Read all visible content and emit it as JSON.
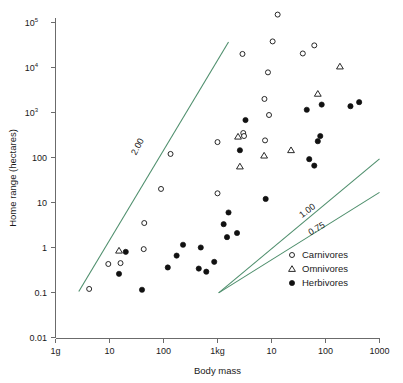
{
  "chart_data": {
    "type": "scatter",
    "title": "",
    "xlabel": "Body mass",
    "ylabel": "Home range (hectares)",
    "x_scale": "log",
    "y_scale": "log",
    "xlim": [
      1,
      1000000
    ],
    "ylim": [
      0.01,
      100000
    ],
    "grid": false,
    "legend_position": "bottom-right",
    "x_tick_labels": [
      "1g",
      "10",
      "100",
      "1kg",
      "10",
      "100",
      "1000"
    ],
    "x_tick_values": [
      1,
      10,
      100,
      1000,
      10000,
      100000,
      1000000
    ],
    "y_tick_labels": [
      "10⁵",
      "10⁴",
      "10³",
      "100",
      "10",
      "1",
      "0.1",
      "0.01"
    ],
    "y_tick_values": [
      100000,
      10000,
      1000,
      100,
      10,
      1,
      0.1,
      0.01
    ],
    "series": [
      {
        "name": "Carnivores",
        "marker": "open-circle",
        "color": "#111111",
        "points": [
          {
            "x": 4.2,
            "y": 0.12
          },
          {
            "x": 9.5,
            "y": 0.43
          },
          {
            "x": 16,
            "y": 0.45
          },
          {
            "x": 43,
            "y": 0.92
          },
          {
            "x": 44,
            "y": 3.5
          },
          {
            "x": 90,
            "y": 20
          },
          {
            "x": 135,
            "y": 120
          },
          {
            "x": 1000,
            "y": 16
          },
          {
            "x": 1000,
            "y": 220
          },
          {
            "x": 2900,
            "y": 20000
          },
          {
            "x": 3000,
            "y": 350
          },
          {
            "x": 3100,
            "y": 300
          },
          {
            "x": 7400,
            "y": 2000
          },
          {
            "x": 7600,
            "y": 240
          },
          {
            "x": 8600,
            "y": 7800
          },
          {
            "x": 9000,
            "y": 880
          },
          {
            "x": 10500,
            "y": 38000
          },
          {
            "x": 13000,
            "y": 150000
          },
          {
            "x": 38000,
            "y": 20500
          },
          {
            "x": 62000,
            "y": 31000
          }
        ]
      },
      {
        "name": "Omnivores",
        "marker": "open-triangle",
        "color": "#111111",
        "points": [
          {
            "x": 15,
            "y": 0.85
          },
          {
            "x": 2400,
            "y": 290
          },
          {
            "x": 2600,
            "y": 63
          },
          {
            "x": 7300,
            "y": 110
          },
          {
            "x": 23000,
            "y": 145
          },
          {
            "x": 72000,
            "y": 2600
          },
          {
            "x": 185000,
            "y": 10500
          }
        ]
      },
      {
        "name": "Herbivores",
        "marker": "filled-circle",
        "color": "#111111",
        "points": [
          {
            "x": 15,
            "y": 0.26
          },
          {
            "x": 20,
            "y": 0.8
          },
          {
            "x": 40,
            "y": 0.115
          },
          {
            "x": 120,
            "y": 0.36
          },
          {
            "x": 175,
            "y": 0.66
          },
          {
            "x": 230,
            "y": 1.15
          },
          {
            "x": 450,
            "y": 0.34
          },
          {
            "x": 490,
            "y": 1.0
          },
          {
            "x": 620,
            "y": 0.29
          },
          {
            "x": 870,
            "y": 0.48
          },
          {
            "x": 1300,
            "y": 3.3
          },
          {
            "x": 1500,
            "y": 1.7
          },
          {
            "x": 1600,
            "y": 6.0
          },
          {
            "x": 2300,
            "y": 2.1
          },
          {
            "x": 2600,
            "y": 145
          },
          {
            "x": 3300,
            "y": 680
          },
          {
            "x": 7800,
            "y": 12
          },
          {
            "x": 45000,
            "y": 1150
          },
          {
            "x": 50000,
            "y": 92
          },
          {
            "x": 62000,
            "y": 66
          },
          {
            "x": 72000,
            "y": 230
          },
          {
            "x": 80000,
            "y": 300
          },
          {
            "x": 85000,
            "y": 1500
          },
          {
            "x": 290000,
            "y": 1380
          },
          {
            "x": 420000,
            "y": 1700
          }
        ]
      }
    ],
    "reference_lines": [
      {
        "label": "2.00",
        "slope": 2.0,
        "color": "#4f8f6d"
      },
      {
        "label": "1.00",
        "slope": 1.0,
        "color": "#4f8f6d"
      },
      {
        "label": "0.75",
        "slope": 0.75,
        "color": "#4f8f6d"
      }
    ]
  },
  "legend": {
    "entries": [
      {
        "label": "Carnivores",
        "marker": "open-circle"
      },
      {
        "label": "Omnivores",
        "marker": "open-triangle"
      },
      {
        "label": "Herbivores",
        "marker": "filled-circle"
      }
    ]
  }
}
